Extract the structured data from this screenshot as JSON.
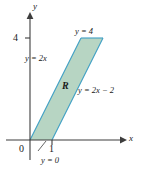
{
  "figure": {
    "axes": {
      "x_label": "x",
      "y_label": "y",
      "origin_label": "0",
      "x_ticks": [
        {
          "value": 1,
          "label": "1"
        }
      ],
      "y_ticks": [
        {
          "value": 4,
          "label": "4"
        }
      ],
      "x_range": [
        -0.45,
        4.1
      ],
      "y_range": [
        -0.9,
        5.4
      ]
    },
    "region": {
      "name": "R",
      "label": "R",
      "vertices": [
        [
          0,
          0
        ],
        [
          1,
          0
        ],
        [
          3,
          4
        ],
        [
          2,
          4
        ]
      ],
      "fill_color": "#b7d5c3",
      "stroke_color": "#3f9fc4"
    },
    "boundaries": [
      {
        "id": "left",
        "label": "y = 2x",
        "equation": "y = 2x"
      },
      {
        "id": "right",
        "label": "y = 2x − 2",
        "equation": "y = 2x - 2"
      },
      {
        "id": "top",
        "label": "y = 4",
        "equation": "y = 4"
      },
      {
        "id": "bottom",
        "label": "y = 0",
        "equation": "y = 0"
      }
    ],
    "colors": {
      "axis": "#3d3d3d",
      "text": "#1a1a1a",
      "region_fill": "#b7d5c3",
      "region_stroke": "#3f9fc4"
    }
  }
}
